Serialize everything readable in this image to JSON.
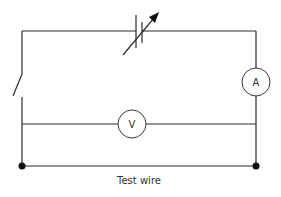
{
  "diagram": {
    "type": "circuit",
    "components": {
      "variable_cell": {
        "label": "",
        "icon": "variable-cell-icon"
      },
      "switch": {
        "label": "",
        "icon": "open-switch-icon"
      },
      "ammeter": {
        "label": "A"
      },
      "voltmeter": {
        "label": "V"
      },
      "test_wire": {
        "label": "Test wire"
      }
    },
    "colors": {
      "wire": "#2b2b2b",
      "meter_outline": "#3a3a3a",
      "text": "#333333",
      "background": "#ffffff"
    }
  }
}
